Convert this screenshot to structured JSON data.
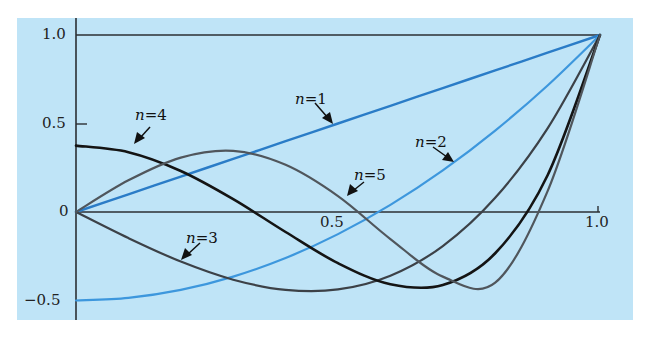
{
  "chart_data": {
    "type": "line",
    "title": "",
    "xlabel": "",
    "ylabel": "",
    "xlim": [
      0,
      1.0
    ],
    "ylim": [
      -0.5,
      1.0
    ],
    "grid": false,
    "legend": "inline arrow labels",
    "x_ticks": [
      {
        "value": 0.5,
        "label": "0.5"
      },
      {
        "value": 1.0,
        "label": "1.0"
      }
    ],
    "y_ticks": [
      {
        "value": 1.0,
        "label": "1.0"
      },
      {
        "value": 0.5,
        "label": "0.5"
      },
      {
        "value": 0,
        "label": "0"
      },
      {
        "value": -0.5,
        "label": "−0.5"
      }
    ],
    "x": [
      0,
      0.1,
      0.2,
      0.3,
      0.4,
      0.5,
      0.6,
      0.7,
      0.8,
      0.9,
      1.0
    ],
    "series": [
      {
        "name": "n=1",
        "color": "#2a7cc7",
        "width": 2.4,
        "values": [
          0,
          0.1,
          0.2,
          0.3,
          0.4,
          0.5,
          0.6,
          0.7,
          0.8,
          0.9,
          1.0
        ]
      },
      {
        "name": "n=2",
        "color": "#3d97dd",
        "width": 2.2,
        "values": [
          -0.5,
          -0.485,
          -0.44,
          -0.365,
          -0.26,
          -0.125,
          0.04,
          0.235,
          0.46,
          0.715,
          1.0
        ]
      },
      {
        "name": "n=3",
        "color": "#3c4147",
        "width": 2.2,
        "values": [
          0,
          -0.1475,
          -0.28,
          -0.3825,
          -0.44,
          -0.4375,
          -0.36,
          -0.1925,
          0.08,
          0.4725,
          1.0
        ]
      },
      {
        "name": "n=4",
        "color": "#141414",
        "width": 2.6,
        "values": [
          0.375,
          0.3379,
          0.232,
          0.0729,
          -0.113,
          -0.2891,
          -0.408,
          -0.4121,
          -0.233,
          0.2079,
          1.0
        ]
      },
      {
        "name": "n=5",
        "color": "#50565c",
        "width": 2.2,
        "values": [
          0,
          0.1788,
          0.3075,
          0.3454,
          0.2666,
          0.0898,
          -0.1526,
          -0.3652,
          -0.3995,
          0.1179,
          1.0
        ]
      }
    ],
    "annotations": [
      {
        "text": "n=1",
        "series": "n=1"
      },
      {
        "text": "n=2",
        "series": "n=2"
      },
      {
        "text": "n=3",
        "series": "n=3"
      },
      {
        "text": "n=4",
        "series": "n=4"
      },
      {
        "text": "n=5",
        "series": "n=5"
      }
    ]
  },
  "labels": {
    "y_1": "1.0",
    "y_05": "0.5",
    "y_0": "0",
    "y_m05": "−0.5",
    "x_05": "0.5",
    "x_1": "1.0",
    "n_var": "n",
    "n1": "=1",
    "n2": "=2",
    "n3": "=3",
    "n4": "=4",
    "n5": "=5"
  }
}
